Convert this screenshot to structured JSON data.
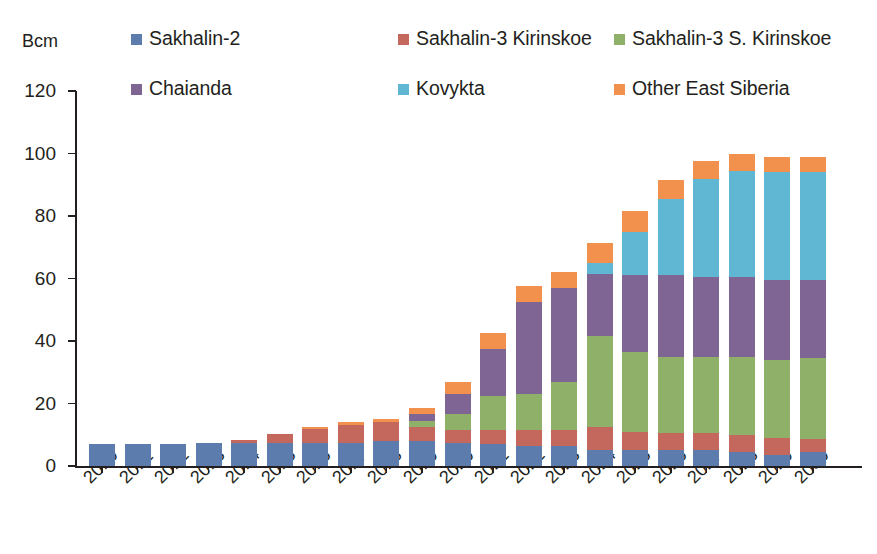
{
  "axis_unit_label": "Bcm",
  "legend": {
    "items": [
      {
        "label": "Sakhalin-2",
        "color": "#5b7cad",
        "icon": "legend-swatch-icon",
        "row": 1,
        "col": 1
      },
      {
        "label": "Sakhalin-3 Kirinskoe",
        "color": "#c4685e",
        "icon": "legend-swatch-icon",
        "row": 1,
        "col": 2
      },
      {
        "label": "Sakhalin-3 S. Kirinskoe",
        "color": "#8fb069",
        "icon": "legend-swatch-icon",
        "row": 1,
        "col": 3
      },
      {
        "label": "Chaianda",
        "color": "#7e6594",
        "icon": "legend-swatch-icon",
        "row": 2,
        "col": 1
      },
      {
        "label": "Kovykta",
        "color": "#5fb7d4",
        "icon": "legend-swatch-icon",
        "row": 2,
        "col": 2
      },
      {
        "label": "Other East Siberia",
        "color": "#f2914e",
        "icon": "legend-swatch-icon",
        "row": 2,
        "col": 3
      }
    ]
  },
  "chart_data": {
    "type": "bar",
    "stacked": true,
    "title": "",
    "xlabel": "",
    "ylabel": "Bcm",
    "ylim": [
      0,
      120
    ],
    "yticks": [
      0,
      20,
      40,
      60,
      80,
      100,
      120
    ],
    "grid": false,
    "legend_position": "top",
    "categories": [
      "2010",
      "2011",
      "2012",
      "2013",
      "2014",
      "2015",
      "2016",
      "2017",
      "2018",
      "2019",
      "2020",
      "2021",
      "2022",
      "2023",
      "2024",
      "2025",
      "2026",
      "2027",
      "2028",
      "2029",
      "2030"
    ],
    "series": [
      {
        "name": "Sakhalin-2",
        "color": "#5b7cad",
        "values": [
          7.0,
          7.0,
          7.2,
          7.3,
          7.5,
          7.5,
          7.5,
          7.5,
          8.0,
          8.0,
          7.5,
          7.0,
          6.5,
          6.5,
          5.0,
          5.0,
          5.0,
          5.0,
          4.5,
          3.5,
          4.5
        ]
      },
      {
        "name": "Sakhalin-3 Kirinskoe",
        "color": "#c4685e",
        "values": [
          0.0,
          0.0,
          0.0,
          0.0,
          0.8,
          2.8,
          4.5,
          5.5,
          6.0,
          4.5,
          4.0,
          4.5,
          5.0,
          5.0,
          7.5,
          6.0,
          5.5,
          5.5,
          5.5,
          5.5,
          4.0
        ]
      },
      {
        "name": "Sakhalin-3 S. Kirinskoe",
        "color": "#8fb069",
        "values": [
          0.0,
          0.0,
          0.0,
          0.0,
          0.0,
          0.0,
          0.0,
          0.0,
          0.0,
          2.0,
          5.0,
          11.0,
          11.5,
          15.5,
          29.0,
          25.5,
          24.5,
          24.5,
          25.0,
          25.0,
          26.0
        ]
      },
      {
        "name": "Chaianda",
        "color": "#7e6594",
        "values": [
          0.0,
          0.0,
          0.0,
          0.0,
          0.0,
          0.0,
          0.0,
          0.0,
          0.0,
          2.0,
          6.5,
          15.0,
          29.5,
          30.0,
          20.0,
          24.5,
          26.0,
          25.5,
          25.5,
          25.5,
          25.0
        ]
      },
      {
        "name": "Kovykta",
        "color": "#5fb7d4",
        "values": [
          0.0,
          0.0,
          0.0,
          0.0,
          0.0,
          0.0,
          0.0,
          0.0,
          0.0,
          0.0,
          0.0,
          0.0,
          0.0,
          0.0,
          3.5,
          14.0,
          24.5,
          31.5,
          34.0,
          34.5,
          34.5
        ]
      },
      {
        "name": "Other East Siberia",
        "color": "#f2914e",
        "values": [
          0.0,
          0.0,
          0.0,
          0.0,
          0.0,
          0.0,
          0.5,
          1.0,
          1.0,
          2.0,
          4.0,
          5.0,
          5.0,
          5.0,
          6.5,
          6.5,
          6.0,
          5.5,
          5.5,
          5.0,
          5.0
        ]
      }
    ],
    "totals": [
      7.0,
      7.0,
      7.2,
      7.3,
      8.3,
      10.3,
      12.5,
      14.0,
      15.0,
      18.5,
      27.0,
      42.5,
      57.5,
      62.0,
      71.5,
      81.5,
      91.5,
      97.5,
      100.0,
      99.0,
      99.0
    ]
  }
}
